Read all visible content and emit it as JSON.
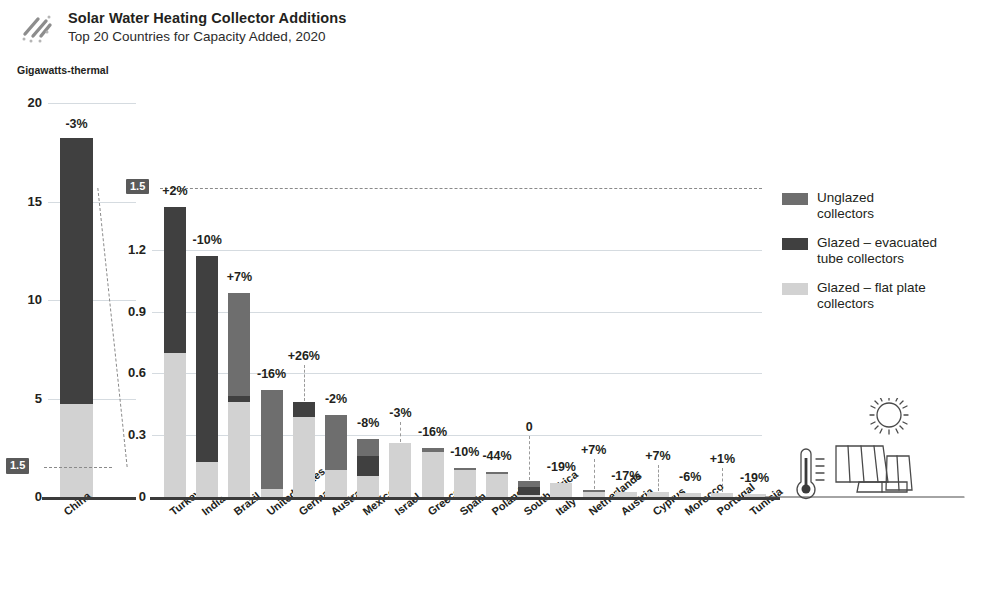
{
  "header": {
    "icon": "diagonal-stripes-icon",
    "title": "Solar Water Heating Collector Additions",
    "subtitle": "Top 20 Countries for Capacity Added, 2020"
  },
  "unit_label": "Gigawatts-thermal",
  "legend": {
    "items": [
      {
        "label": "Unglazed\ncollectors",
        "color": "#6e6e6e",
        "key": "unglazed"
      },
      {
        "label": "Glazed – evacuated\ntube collectors",
        "color": "#404040",
        "key": "evacuated"
      },
      {
        "label": "Glazed – flat plate\ncollectors",
        "color": "#d2d2d2",
        "key": "flatplate"
      }
    ]
  },
  "illustration": {
    "sun": "sun-icon",
    "thermometer": "thermometer-icon",
    "panels": "solar-collector-panels-icon"
  },
  "chart_data": {
    "type": "bar",
    "subtype": "stacked-bar, dual-panel with broken axis",
    "title": "Solar Water Heating Collector Additions",
    "subtitle": "Top 20 Countries for Capacity Added, 2020",
    "ylabel": "Gigawatts-thermal",
    "xlabel": "",
    "grid": true,
    "legend_position": "right",
    "series": [
      {
        "name": "Unglazed collectors",
        "color": "#6e6e6e"
      },
      {
        "name": "Glazed – evacuated tube collectors",
        "color": "#404040"
      },
      {
        "name": "Glazed – flat plate collectors",
        "color": "#d2d2d2"
      }
    ],
    "left_panel": {
      "ylim": [
        0,
        20
      ],
      "yticks": [
        0,
        5,
        10,
        15,
        20
      ],
      "ytick_labels": [
        "0",
        "5",
        "10",
        "15",
        "20"
      ],
      "marker_label": "1.5",
      "marker_value": 1.5,
      "categories": [
        "China"
      ],
      "bars": [
        {
          "country": "China",
          "change": "-3%",
          "total": 18.2,
          "segments": [
            {
              "series": "flatplate",
              "value": 4.7
            },
            {
              "series": "evacuated",
              "value": 13.5
            },
            {
              "series": "unglazed",
              "value": 0.0
            }
          ]
        }
      ]
    },
    "right_panel": {
      "ylim": [
        0,
        1.5
      ],
      "yticks": [
        0,
        0.3,
        0.6,
        0.9,
        1.2,
        1.5
      ],
      "ytick_labels": [
        "0",
        "0.3",
        "0.6",
        "0.9",
        "1.2",
        "1.5"
      ],
      "top_label": "1.5",
      "categories": [
        "Turkey",
        "India",
        "Brazil",
        "United States",
        "Germany",
        "Australia",
        "Mexico",
        "Israel",
        "Greece",
        "Spain",
        "Poland",
        "South Africa",
        "Italy",
        "Netherlands",
        "Austria",
        "Cyprus",
        "Morocco",
        "Portugal",
        "Tunisia"
      ],
      "bars": [
        {
          "country": "Turkey",
          "change": "+2%",
          "total": 1.41,
          "segments": [
            {
              "series": "flatplate",
              "value": 0.7
            },
            {
              "series": "evacuated",
              "value": 0.71
            },
            {
              "series": "unglazed",
              "value": 0.0
            }
          ]
        },
        {
          "country": "India",
          "change": "-10%",
          "total": 1.17,
          "segments": [
            {
              "series": "flatplate",
              "value": 0.17
            },
            {
              "series": "evacuated",
              "value": 1.0
            },
            {
              "series": "unglazed",
              "value": 0.0
            }
          ]
        },
        {
          "country": "Brazil",
          "change": "+7%",
          "total": 0.99,
          "segments": [
            {
              "series": "flatplate",
              "value": 0.46
            },
            {
              "series": "evacuated",
              "value": 0.03
            },
            {
              "series": "unglazed",
              "value": 0.5
            }
          ]
        },
        {
          "country": "United States",
          "change": "-16%",
          "total": 0.52,
          "segments": [
            {
              "series": "flatplate",
              "value": 0.04
            },
            {
              "series": "evacuated",
              "value": 0.0
            },
            {
              "series": "unglazed",
              "value": 0.48
            }
          ]
        },
        {
          "country": "Germany",
          "change": "+26%",
          "total": 0.46,
          "segments": [
            {
              "series": "flatplate",
              "value": 0.39
            },
            {
              "series": "evacuated",
              "value": 0.07
            },
            {
              "series": "unglazed",
              "value": 0.0
            }
          ]
        },
        {
          "country": "Australia",
          "change": "-2%",
          "total": 0.4,
          "segments": [
            {
              "series": "flatplate",
              "value": 0.13
            },
            {
              "series": "evacuated",
              "value": 0.0
            },
            {
              "series": "unglazed",
              "value": 0.27
            }
          ]
        },
        {
          "country": "Mexico",
          "change": "-8%",
          "total": 0.28,
          "segments": [
            {
              "series": "flatplate",
              "value": 0.1
            },
            {
              "series": "evacuated",
              "value": 0.1
            },
            {
              "series": "unglazed",
              "value": 0.08
            }
          ]
        },
        {
          "country": "Israel",
          "change": "-3%",
          "total": 0.26,
          "segments": [
            {
              "series": "flatplate",
              "value": 0.26
            },
            {
              "series": "evacuated",
              "value": 0.0
            },
            {
              "series": "unglazed",
              "value": 0.0
            }
          ]
        },
        {
          "country": "Greece",
          "change": "-16%",
          "total": 0.24,
          "segments": [
            {
              "series": "flatplate",
              "value": 0.22
            },
            {
              "series": "evacuated",
              "value": 0.0
            },
            {
              "series": "unglazed",
              "value": 0.02
            }
          ]
        },
        {
          "country": "Spain",
          "change": "-10%",
          "total": 0.14,
          "segments": [
            {
              "series": "flatplate",
              "value": 0.13
            },
            {
              "series": "evacuated",
              "value": 0.0
            },
            {
              "series": "unglazed",
              "value": 0.01
            }
          ]
        },
        {
          "country": "Poland",
          "change": "-44%",
          "total": 0.12,
          "segments": [
            {
              "series": "flatplate",
              "value": 0.11
            },
            {
              "series": "evacuated",
              "value": 0.0
            },
            {
              "series": "unglazed",
              "value": 0.01
            }
          ]
        },
        {
          "country": "South Africa",
          "change": "0",
          "total": 0.08,
          "segments": [
            {
              "series": "flatplate",
              "value": 0.01
            },
            {
              "series": "evacuated",
              "value": 0.04
            },
            {
              "series": "unglazed",
              "value": 0.03
            }
          ]
        },
        {
          "country": "Italy",
          "change": "-19%",
          "total": 0.07,
          "segments": [
            {
              "series": "flatplate",
              "value": 0.07
            },
            {
              "series": "evacuated",
              "value": 0.0
            },
            {
              "series": "unglazed",
              "value": 0.0
            }
          ]
        },
        {
          "country": "Netherlands",
          "change": "+7%",
          "total": 0.035,
          "segments": [
            {
              "series": "flatplate",
              "value": 0.022
            },
            {
              "series": "evacuated",
              "value": 0.0
            },
            {
              "series": "unglazed",
              "value": 0.013
            }
          ]
        },
        {
          "country": "Austria",
          "change": "-17%",
          "total": 0.022,
          "segments": [
            {
              "series": "flatplate",
              "value": 0.022
            },
            {
              "series": "evacuated",
              "value": 0.0
            },
            {
              "series": "unglazed",
              "value": 0.0
            }
          ]
        },
        {
          "country": "Cyprus",
          "change": "+7%",
          "total": 0.022,
          "segments": [
            {
              "series": "flatplate",
              "value": 0.022
            },
            {
              "series": "evacuated",
              "value": 0.0
            },
            {
              "series": "unglazed",
              "value": 0.0
            }
          ]
        },
        {
          "country": "Morocco",
          "change": "-6%",
          "total": 0.02,
          "segments": [
            {
              "series": "flatplate",
              "value": 0.02
            },
            {
              "series": "evacuated",
              "value": 0.0
            },
            {
              "series": "unglazed",
              "value": 0.0
            }
          ]
        },
        {
          "country": "Portugal",
          "change": "+1%",
          "total": 0.018,
          "segments": [
            {
              "series": "flatplate",
              "value": 0.018
            },
            {
              "series": "evacuated",
              "value": 0.0
            },
            {
              "series": "unglazed",
              "value": 0.0
            }
          ]
        },
        {
          "country": "Tunisia",
          "change": "-19%",
          "total": 0.015,
          "segments": [
            {
              "series": "flatplate",
              "value": 0.015
            },
            {
              "series": "evacuated",
              "value": 0.0
            },
            {
              "series": "unglazed",
              "value": 0.0
            }
          ]
        }
      ]
    }
  }
}
